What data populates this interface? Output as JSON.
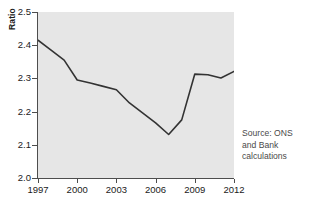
{
  "axes": {
    "y_title": "Ratio",
    "y_ticks": [
      "2.0",
      "2.1",
      "2.2",
      "2.3",
      "2.4",
      "2.5"
    ],
    "x_ticks": [
      "1997",
      "2000",
      "2003",
      "2006",
      "2009",
      "2012"
    ]
  },
  "source": {
    "line1": "Source: ONS",
    "line2": "and Bank",
    "line3": "calculations"
  },
  "colors": {
    "plot_background": "#e6e6e6",
    "line": "#333333",
    "axis": "#4d4d4d",
    "text": "#1a1a1a",
    "source_text": "#4a4a4a"
  },
  "chart_data": {
    "type": "line",
    "title": "",
    "xlabel": "",
    "ylabel": "Ratio",
    "xlim": [
      1997,
      2012
    ],
    "ylim": [
      2.0,
      2.5
    ],
    "ytick_values": [
      2.0,
      2.1,
      2.2,
      2.3,
      2.4,
      2.5
    ],
    "xtick_values": [
      1997,
      2000,
      2003,
      2006,
      2009,
      2012
    ],
    "grid": false,
    "legend": null,
    "x": [
      1997,
      1998,
      1999,
      2000,
      2001,
      2002,
      2003,
      2004,
      2005,
      2006,
      2007,
      2008,
      2009,
      2010,
      2011,
      2012
    ],
    "values": [
      2.415,
      2.385,
      2.355,
      2.295,
      2.286,
      2.276,
      2.266,
      2.226,
      2.196,
      2.166,
      2.131,
      2.175,
      2.313,
      2.311,
      2.301,
      2.321
    ],
    "series": [
      {
        "name": "Ratio",
        "values": [
          2.415,
          2.385,
          2.355,
          2.295,
          2.286,
          2.276,
          2.266,
          2.226,
          2.196,
          2.166,
          2.131,
          2.175,
          2.313,
          2.311,
          2.301,
          2.321
        ]
      }
    ],
    "annotations": [
      "Source: ONS and Bank calculations"
    ]
  }
}
